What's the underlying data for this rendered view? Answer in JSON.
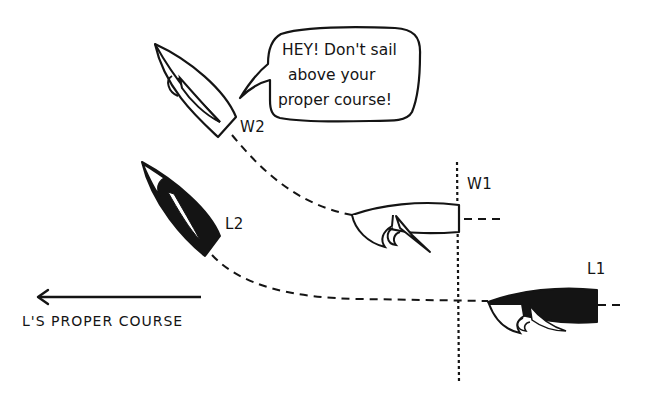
{
  "diagram": {
    "type": "sailing-rules-illustration",
    "colors": {
      "ink": "#141414",
      "background": "#ffffff"
    },
    "speech_bubble": {
      "speaker": "L2",
      "lines": [
        "HEY! Don't sail",
        "above your",
        "proper course!"
      ]
    },
    "boats": [
      {
        "id": "W2",
        "label": "W2",
        "hull": "white",
        "heading": "upwind-diagonal"
      },
      {
        "id": "L2",
        "label": "L2",
        "hull": "black",
        "heading": "upwind-diagonal"
      },
      {
        "id": "W1",
        "label": "W1",
        "hull": "white",
        "heading": "west"
      },
      {
        "id": "L1",
        "label": "L1",
        "hull": "black",
        "heading": "west"
      }
    ],
    "paths": [
      {
        "from": "W2",
        "to": "W1",
        "style": "dashed"
      },
      {
        "from": "L2",
        "to": "L1",
        "style": "dashed"
      }
    ],
    "reference_line": {
      "style": "dotted",
      "orientation": "vertical",
      "through": "W1-stern"
    },
    "course_arrow": {
      "direction": "left",
      "label": "L'S PROPER COURSE"
    }
  }
}
